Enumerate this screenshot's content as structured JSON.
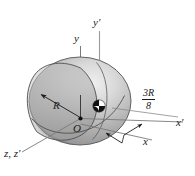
{
  "figure": {
    "background_color": "#ffffff",
    "line_color": "#6b6b6b",
    "text_color": "#1a1a1a",
    "body": {
      "name": "sphere",
      "fill_light": "#e8e8e8",
      "fill_mid": "#b8b8b8",
      "fill_dark": "#8d8d8d",
      "outline_color": "#4a4a4a"
    },
    "labels": {
      "y_axis": "y",
      "y_prime_axis": "y'",
      "x_axis": "x",
      "x_prime_axis": "x'",
      "z_axes": "z, z'",
      "origin": "O",
      "radius": "R"
    },
    "dimension": {
      "name": "offset-distance",
      "numerator": "3R",
      "denominator": "8"
    }
  }
}
